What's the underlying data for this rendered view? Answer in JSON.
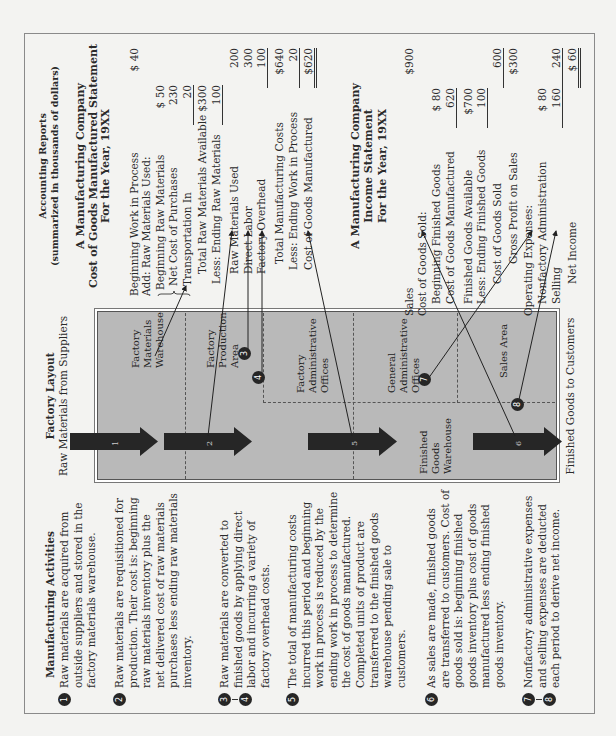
{
  "activities": {
    "title": "Manufacturing Activities",
    "items": [
      {
        "badges": [
          "1"
        ],
        "lines": [
          "Raw materials are acquired from",
          "outside suppliers and stored in the",
          "factory materials warehouse."
        ]
      },
      {
        "badges": [
          "2"
        ],
        "lines": [
          "Raw materials are requisitioned for",
          "production. Their cost is: beginning",
          "raw materials inventory plus the",
          "net delivered cost of raw materials",
          "purchases less ending raw materials",
          "inventory."
        ]
      },
      {
        "badges": [
          "3",
          "4"
        ],
        "lines": [
          "Raw materials are converted to",
          "finished goods by applying direct",
          "labor and incurring a variety of",
          "factory overhead costs."
        ]
      },
      {
        "badges": [
          "5"
        ],
        "lines": [
          "The total of manufacturing costs",
          "incurred this period and beginning",
          "work in process is reduced by the",
          "ending work in process to determine",
          "the cost of goods manufactured.",
          "Completed units of product are",
          "transferred to the finished goods",
          "warehouse pending sale to",
          "customers."
        ]
      },
      {
        "badges": [
          "6"
        ],
        "lines": [
          "As sales are made, finished goods",
          "are transferred to customers. Cost of",
          "goods sold is: beginning finished",
          "goods inventory plus cost of goods",
          "manufactured less ending finished",
          "goods inventory."
        ]
      },
      {
        "badges": [
          "7",
          "8"
        ],
        "lines": [
          "Nonfactory administrative expenses",
          "and selling expenses are deducted",
          "each period to derive net income."
        ]
      }
    ]
  },
  "layout": {
    "title": "Factory Layout",
    "subtitle": "Raw Materials from Suppliers",
    "bottom_label": "Finished Goods to Customers",
    "areas": {
      "materials_warehouse": [
        "Factory",
        "Materials",
        "Warehouse"
      ],
      "production_area": [
        "Factory",
        "Production",
        "Area"
      ],
      "factory_admin": [
        "Factory",
        "Administrative",
        "Offices"
      ],
      "general_admin": [
        "General",
        "Administrative",
        "Offices"
      ],
      "sales_area": [
        "Sales Area"
      ],
      "finished_goods_warehouse": [
        "Finished",
        "Goods",
        "Warehouse"
      ]
    },
    "arrows": [
      "1",
      "2",
      "5",
      "6"
    ],
    "badges": [
      "3",
      "4",
      "7",
      "8"
    ],
    "colors": {
      "box": "#b9b9b9",
      "arrow": "#262626"
    }
  },
  "reports": {
    "title": "Accounting Reports",
    "subtitle": "(summarized in thousands of dollars)",
    "cgm": {
      "heading": [
        "A Manufacturing Company",
        "Cost of Goods Manufactured Statement",
        "For the Year, 19XX"
      ],
      "rows": [
        {
          "label": "Beginning Work in Process",
          "c3": "$ 40"
        },
        {
          "label": "Add: Raw Materials Used:"
        },
        {
          "label": "Beginning Raw Materials",
          "c2": "$ 50"
        },
        {
          "label": "Net Cost of Purchases",
          "c2": "230"
        },
        {
          "label": "Transportation In",
          "c2": "20"
        },
        {
          "label": "Total Raw Materials Available",
          "c2": "$300"
        },
        {
          "label": "Less: Ending Raw Materials",
          "c2": "100"
        },
        {
          "label": "Raw Materials Used",
          "c3": "200"
        },
        {
          "label": "Direct Labor",
          "c3": "300"
        },
        {
          "label": "Factory Overhead",
          "c3": "100"
        },
        {
          "label": "Total Manufacturing Costs",
          "c3": "$640"
        },
        {
          "label": "Less: Ending Work in Process",
          "c3": "20"
        },
        {
          "label": "Cost of Goods Manufactured",
          "c3": "$620"
        }
      ]
    },
    "income": {
      "heading": [
        "A Manufacturing Company",
        "Income Statement",
        "For the Year, 19XX"
      ],
      "rows": [
        {
          "label": "Sales",
          "c3": "$900"
        },
        {
          "label": "Cost of Goods Sold:"
        },
        {
          "label": "Beginning Finished Goods",
          "c2": "$ 80"
        },
        {
          "label": "Cost of Goods Manufactured",
          "c2": "620"
        },
        {
          "label": "Finished Goods Available",
          "c2": "$700"
        },
        {
          "label": "Less: Ending Finished Goods",
          "c2": "100"
        },
        {
          "label": "Cost of Goods Sold",
          "c3": "600"
        },
        {
          "label": "Gross Profit on Sales",
          "c3": "$300"
        },
        {
          "label": "Operating Expenses:"
        },
        {
          "label": "Nonfactory Administration",
          "c2": "$ 80"
        },
        {
          "label": "Selling",
          "c2": "160",
          "c3": "240"
        },
        {
          "label": "Net Income",
          "c3": "$ 60"
        }
      ]
    }
  }
}
